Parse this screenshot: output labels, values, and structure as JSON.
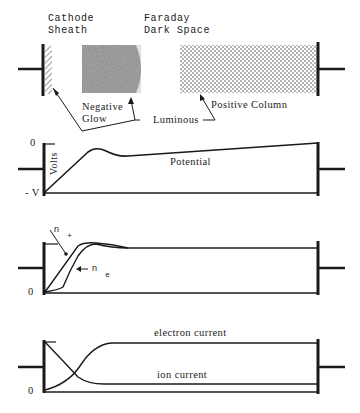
{
  "regions": {
    "cathode_sheath": [
      "Cathode",
      "Sheath"
    ],
    "faraday_dark_space": [
      "Faraday",
      "Dark Space"
    ],
    "negative_glow": [
      "Negative",
      "Glow"
    ],
    "luminous": "Luminous",
    "positive_column": "Positive Column"
  },
  "potential_panel": {
    "y_top": "0",
    "y_bottom": "- V",
    "axis_label": "Volts",
    "curve_label": "Potential"
  },
  "density_panel": {
    "y_zero": "0",
    "n_plus": "n",
    "n_plus_sub": "+",
    "n_e": "n",
    "n_e_sub": "e"
  },
  "current_panel": {
    "y_zero": "0",
    "electron_label": "electron current",
    "ion_label": "ion current"
  },
  "colors": {
    "ink": "#1a1a1a",
    "glow": "#8a8a8a",
    "dots": "#555555"
  }
}
